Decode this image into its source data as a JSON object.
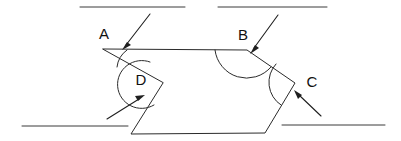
{
  "figure": {
    "background_color": "#ffffff",
    "stroke_color": "#2b2b2b",
    "width": 401,
    "height": 141
  },
  "labels": {
    "a": "A",
    "b": "B",
    "c": "C",
    "d": "D"
  },
  "label_positions": {
    "a": {
      "x": 104,
      "y": 35
    },
    "b": {
      "x": 243,
      "y": 36
    },
    "c": {
      "x": 312,
      "y": 83
    },
    "d": {
      "x": 141,
      "y": 81
    }
  },
  "vertices": {
    "a": {
      "x": 103,
      "y": 49
    },
    "b": {
      "x": 247,
      "y": 50
    },
    "c": {
      "x": 295,
      "y": 83
    },
    "d": {
      "x": 163,
      "y": 83
    },
    "bottom_left": {
      "x": 131,
      "y": 134
    },
    "bottom_right": {
      "x": 265,
      "y": 133
    }
  },
  "polygon_path": "M 103 49 L 247 50 L 295 83 L 265 133 L 131 134 L 163 83 Z",
  "guide_lines": [
    {
      "name": "top-left-parallel-line",
      "x1": 80,
      "y1": 7,
      "x2": 185,
      "y2": 7
    },
    {
      "name": "top-right-parallel-line",
      "x1": 218,
      "y1": 7,
      "x2": 327,
      "y2": 7
    },
    {
      "name": "bottom-left-parallel-line",
      "x1": 22,
      "y1": 126,
      "x2": 128,
      "y2": 126
    },
    {
      "name": "bottom-right-parallel-line",
      "x1": 282,
      "y1": 125,
      "x2": 385,
      "y2": 125
    }
  ],
  "angle_arcs": [
    {
      "name": "angle-arc-a",
      "path": "M 127 50 A 24 24 0 0 0 117 67"
    },
    {
      "name": "angle-arc-b",
      "path": "M 215 50 A 32 32 0 0 0 271 67"
    },
    {
      "name": "angle-arc-c",
      "path": "M 276 64 A 27 27 0 0 0 281 105"
    },
    {
      "name": "angle-arc-d",
      "path": "M 150 62 A 24 24 0 1 0 154 105"
    }
  ],
  "pointers": [
    {
      "name": "pointer-to-angle-a",
      "line": {
        "x1": 150,
        "y1": 14,
        "x2": 126,
        "y2": 45
      },
      "head": "M 122 50 L 131 45 L 127 42 Z"
    },
    {
      "name": "pointer-to-angle-b",
      "line": {
        "x1": 278,
        "y1": 15,
        "x2": 254,
        "y2": 48
      },
      "head": "M 250 54 L 259 48 L 255 45 Z"
    },
    {
      "name": "pointer-to-angle-c",
      "line": {
        "x1": 321,
        "y1": 116,
        "x2": 299,
        "y2": 95
      },
      "head": "M 294 90 L 298 99 L 302 95 Z"
    },
    {
      "name": "pointer-to-angle-d",
      "line": {
        "x1": 107,
        "y1": 119,
        "x2": 139,
        "y2": 99
      },
      "head": "M 145 95 L 135 96 L 138 101 Z"
    }
  ]
}
